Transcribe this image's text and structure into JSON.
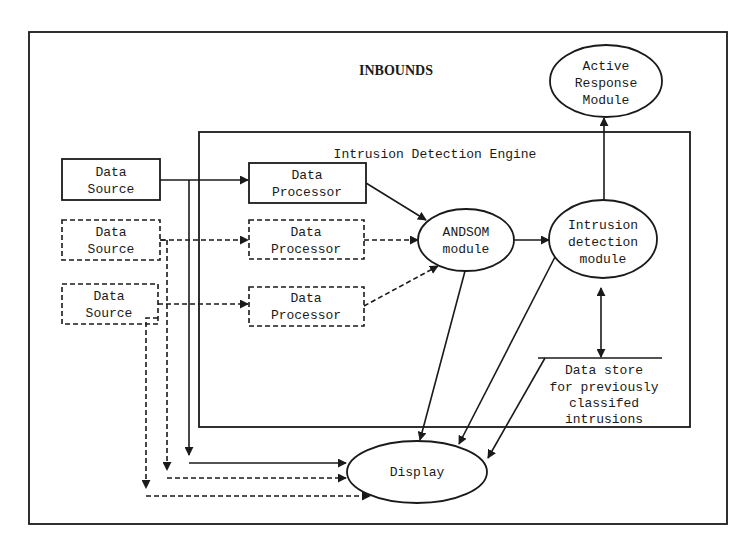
{
  "diagram": {
    "outer_label": "INBOUNDS",
    "engine_label": "Intrusion Detection Engine",
    "data_sources": [
      {
        "line1": "Data",
        "line2": "Source",
        "style": "solid"
      },
      {
        "line1": "Data",
        "line2": "Source",
        "style": "dashed"
      },
      {
        "line1": "Data",
        "line2": "Source",
        "style": "dashed"
      }
    ],
    "data_processors": [
      {
        "line1": "Data",
        "line2": "Processor",
        "style": "solid"
      },
      {
        "line1": "Data",
        "line2": "Processor",
        "style": "dashed"
      },
      {
        "line1": "Data",
        "line2": "Processor",
        "style": "dashed"
      }
    ],
    "andsom": {
      "line1": "ANDSOM",
      "line2": "module"
    },
    "intrusion_detection": {
      "line1": "Intrusion",
      "line2": "detection",
      "line3": "module"
    },
    "active_response": {
      "line1": "Active",
      "line2": "Response",
      "line3": "Module"
    },
    "data_store": {
      "line1": "Data store",
      "line2": "for previously",
      "line3": "classifed",
      "line4": "intrusions"
    },
    "display": {
      "label": "Display"
    },
    "colors": {
      "stroke": "#1a1a1a",
      "background": "#ffffff"
    }
  }
}
